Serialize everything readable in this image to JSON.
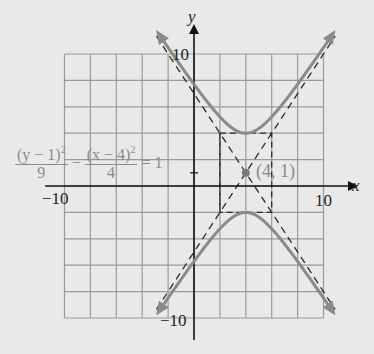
{
  "diagram": {
    "type": "hyperbola-graph",
    "equation": {
      "term1_numerator": "(y − 1)",
      "term1_exponent": "2",
      "term1_denominator": "9",
      "operator": "−",
      "term2_numerator": "(x − 4)",
      "term2_exponent": "2",
      "term2_denominator": "4",
      "equals": "=",
      "rhs": "1"
    },
    "center_label": "(4, 1)",
    "center": [
      4,
      1
    ],
    "a": 3,
    "b": 2,
    "axes": {
      "x_label": "x",
      "y_label": "y",
      "x_range": [
        -10,
        10
      ],
      "y_range": [
        -10,
        10
      ],
      "grid_step": 2
    },
    "tick_labels": {
      "x_neg": "−10",
      "x_pos": "10",
      "y_pos": "10",
      "y_neg": "−10",
      "y_one": "1"
    },
    "asymptotes": [
      "y − 1 = (3/2)(x − 4)",
      "y − 1 = −(3/2)(x − 4)"
    ],
    "fundamental_rectangle": {
      "x": [
        2,
        6
      ],
      "y": [
        -2,
        4
      ]
    },
    "colors": {
      "background": "#e9e9e9",
      "grid": "#9a9a9a",
      "curve": "#8a8a8a",
      "dashed": "#2a2a2a",
      "axis": "#111111",
      "center_dot": "#7a7a7a"
    }
  }
}
